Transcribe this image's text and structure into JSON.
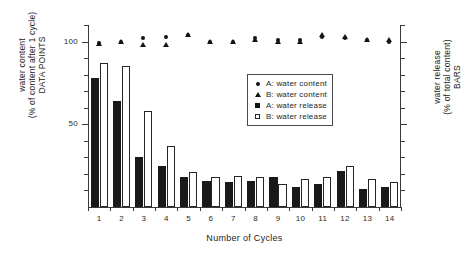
{
  "chart_data": {
    "type": "bar",
    "title": "",
    "subtitle": "",
    "xlabel": "Number of Cycles",
    "ylabel_left": "water content\n(% of content after 1 cycle)\nDATA POINTS",
    "ylabel_left_lines": [
      "water content",
      "(% of content after 1 cycle)",
      "DATA POINTS"
    ],
    "ylabel_right": "water release\n(% of total content)\nBARS",
    "ylabel_right_lines": [
      "water release",
      "(% of total content)",
      "BARS"
    ],
    "categories": [
      1,
      2,
      3,
      4,
      5,
      6,
      7,
      8,
      9,
      10,
      11,
      12,
      13,
      14
    ],
    "xtick_labels": [
      "1",
      "2",
      "3",
      "4",
      "5",
      "6",
      "7",
      "8",
      "9",
      "10",
      "11",
      "12",
      "13",
      "14"
    ],
    "ylim": [
      0,
      110
    ],
    "ytick_labels": [
      "50",
      "100"
    ],
    "ytick_values": [
      50,
      100
    ],
    "yminor_values": [
      10,
      20,
      30,
      40,
      60,
      70,
      80,
      90,
      100,
      110
    ],
    "grid": false,
    "legend_position": "center-right-inside",
    "series": [
      {
        "name": "A: water content",
        "type": "scatter",
        "marker": "filled-circle",
        "axis": "left",
        "color": "#141414",
        "values": [
          99,
          100,
          102,
          103,
          104,
          100,
          100,
          102,
          101,
          101,
          103,
          102,
          101,
          100
        ]
      },
      {
        "name": "B: water content",
        "type": "scatter",
        "marker": "filled-triangle",
        "axis": "left",
        "color": "#141414",
        "values": [
          99,
          100,
          98,
          98,
          104,
          100,
          100,
          101,
          100,
          100,
          104,
          103,
          101,
          101
        ]
      },
      {
        "name": "A: water release",
        "type": "bar",
        "fill": "solid",
        "axis": "right",
        "color": "#191919",
        "values": [
          78,
          64,
          30,
          25,
          18,
          16,
          15,
          16,
          18,
          12,
          14,
          22,
          11,
          12
        ]
      },
      {
        "name": "B: water release",
        "type": "bar",
        "fill": "open",
        "axis": "right",
        "color": "#ffffff",
        "edge_color": "#262626",
        "values": [
          87,
          85,
          58,
          37,
          21,
          18,
          19,
          18,
          14,
          17,
          18,
          25,
          17,
          15
        ]
      }
    ]
  },
  "legend": {
    "items": [
      {
        "key": "filled-circle",
        "label": "A: water content"
      },
      {
        "key": "filled-triangle",
        "label": "B: water content"
      },
      {
        "key": "filled-square",
        "label": "A: water release"
      },
      {
        "key": "open-square",
        "label": "B: water release"
      }
    ]
  },
  "colors": {
    "axis": "#3a3a3a",
    "text": "#242424",
    "bar_filled": "#191919",
    "bar_open_edge": "#262626",
    "background": "#ffffff"
  }
}
